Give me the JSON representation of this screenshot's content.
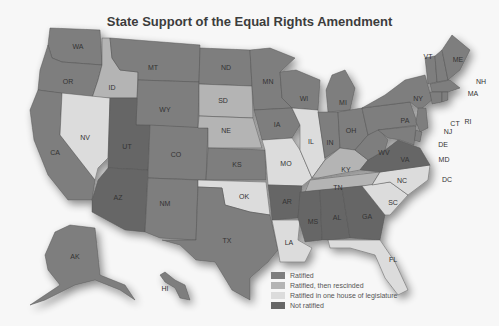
{
  "title": "State Support of the Equal Rights Amendment",
  "colors": {
    "ratified": "#7e7e7e",
    "rescinded": "#b4b4b4",
    "one_house": "#dcdcdc",
    "not_ratified": "#666666"
  },
  "legend": [
    {
      "key": "ratified",
      "label": "Ratified"
    },
    {
      "key": "rescinded",
      "label": "Ratified, then rescinded"
    },
    {
      "key": "one_house",
      "label": "Ratified in one house of legislature"
    },
    {
      "key": "not_ratified",
      "label": "Not ratified"
    }
  ],
  "states": {
    "ratified": [
      "WA",
      "OR",
      "CA",
      "MT",
      "WY",
      "CO",
      "NM",
      "TX",
      "ND",
      "MN",
      "IA",
      "KS",
      "WI",
      "MI",
      "IN",
      "OH",
      "WV",
      "PA",
      "NY",
      "ME",
      "VT",
      "NH",
      "MA",
      "RI",
      "CT",
      "NJ",
      "DE",
      "MD",
      "AK",
      "HI"
    ],
    "rescinded": [
      "ID",
      "SD",
      "NE",
      "KY",
      "TN"
    ],
    "one_house": [
      "NV",
      "IL",
      "MO",
      "OK",
      "LA",
      "NC",
      "SC",
      "FL"
    ],
    "not_ratified": [
      "UT",
      "AZ",
      "AR",
      "MS",
      "AL",
      "GA",
      "VA"
    ]
  },
  "labels": {
    "WA": "WA",
    "OR": "OR",
    "CA": "CA",
    "ID": "ID",
    "NV": "NV",
    "MT": "MT",
    "WY": "WY",
    "UT": "UT",
    "AZ": "AZ",
    "CO": "CO",
    "NM": "NM",
    "ND": "ND",
    "SD": "SD",
    "NE": "NE",
    "KS": "KS",
    "OK": "OK",
    "TX": "TX",
    "MN": "MN",
    "IA": "IA",
    "MO": "MO",
    "AR": "AR",
    "LA": "LA",
    "WI": "WI",
    "IL": "IL",
    "MI": "MI",
    "IN": "IN",
    "OH": "OH",
    "KY": "KY",
    "TN": "TN",
    "MS": "MS",
    "AL": "AL",
    "GA": "GA",
    "FL": "FL",
    "SC": "SC",
    "NC": "NC",
    "VA": "VA",
    "WV": "WV",
    "PA": "PA",
    "NY": "NY",
    "VT": "VT",
    "NH": "NH",
    "ME": "ME",
    "MA": "MA",
    "RI": "RI",
    "CT": "CT",
    "NJ": "NJ",
    "DE": "DE",
    "MD": "MD",
    "DC": "DC",
    "AK": "AK",
    "HI": "HI"
  }
}
